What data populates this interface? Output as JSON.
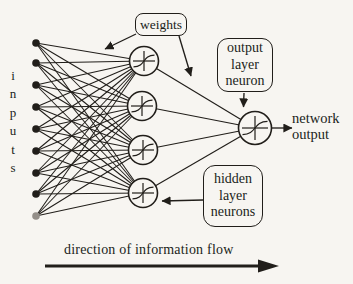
{
  "diagram": {
    "paper_color": "#f7f5f1",
    "ink_color": "#211e1a",
    "muted_input_dot_color": "#948f89",
    "input_count": 9,
    "hidden_count": 4,
    "output_count": 1,
    "inputs_label_letters": [
      "i",
      "n",
      "p",
      "u",
      "t",
      "s"
    ],
    "weights_label": "weights",
    "output_box_lines": [
      "output",
      "layer",
      "neuron"
    ],
    "hidden_box_lines": [
      "hidden",
      "layer",
      "neurons"
    ],
    "network_output_lines": [
      "network",
      "output"
    ],
    "flow_label": "direction of information flow"
  }
}
